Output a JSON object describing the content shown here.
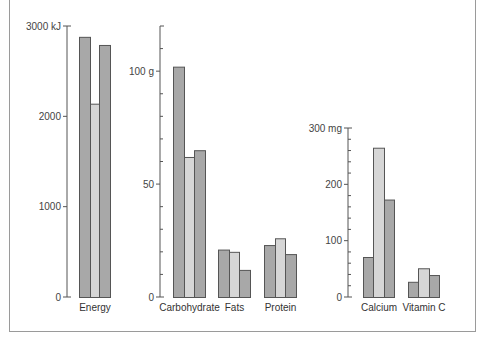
{
  "chart_data": [
    {
      "type": "bar",
      "title": "",
      "xlabel": "",
      "ylabel": "",
      "unit": "kJ",
      "categories": [
        "Energy"
      ],
      "series": [
        {
          "name": "Series 1",
          "values": [
            2880
          ]
        },
        {
          "name": "Series 2",
          "values": [
            2140
          ]
        },
        {
          "name": "Series 3",
          "values": [
            2790
          ]
        }
      ],
      "yticks": [
        "0",
        "1000",
        "2000",
        "3000 kJ"
      ],
      "ylim": [
        0,
        3000
      ],
      "grid": false
    },
    {
      "type": "bar",
      "title": "",
      "xlabel": "",
      "ylabel": "",
      "unit": "g",
      "categories": [
        "Carbohydrate",
        "Fats",
        "Protein"
      ],
      "series": [
        {
          "name": "Series 1",
          "values": [
            102,
            21,
            23
          ]
        },
        {
          "name": "Series 2",
          "values": [
            62,
            20,
            26
          ]
        },
        {
          "name": "Series 3",
          "values": [
            65,
            12,
            19
          ]
        }
      ],
      "yticks": [
        "0",
        "50",
        "100 g"
      ],
      "minor_tick_step": 10,
      "ylim": [
        0,
        120
      ],
      "grid": false
    },
    {
      "type": "bar",
      "title": "",
      "xlabel": "",
      "ylabel": "",
      "unit": "mg",
      "categories": [
        "Calcium",
        "Vitamin C"
      ],
      "series": [
        {
          "name": "Series 1",
          "values": [
            71,
            27
          ]
        },
        {
          "name": "Series 2",
          "values": [
            265,
            51
          ]
        },
        {
          "name": "Series 3",
          "values": [
            173,
            39
          ]
        }
      ],
      "yticks": [
        "0",
        "100",
        "200",
        "300 mg"
      ],
      "minor_tick_step": 20,
      "ylim": [
        0,
        300
      ],
      "grid": false
    }
  ],
  "colors": {
    "series_dark": "#a8a8a8",
    "series_light": "#d6d6d6",
    "bar_outline": "#555555",
    "axis": "#555555",
    "frame": "#9a9a9a"
  }
}
